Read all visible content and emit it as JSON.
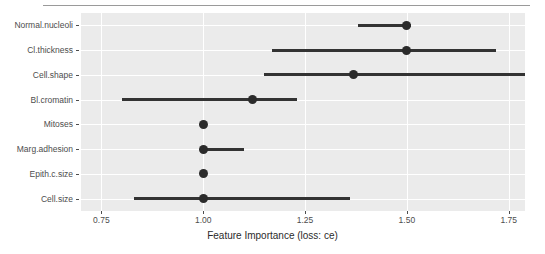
{
  "chart_data": {
    "type": "bar",
    "title": "",
    "subtitle": "",
    "xlabel": "Feature Importance (loss: ce)",
    "ylabel": "",
    "xlim": [
      0.7,
      1.79
    ],
    "xticks": [
      0.75,
      1.0,
      1.25,
      1.5,
      1.75
    ],
    "xticklabels": [
      "0.75",
      "1.00",
      "1.25",
      "1.50",
      "1.75"
    ],
    "grid": true,
    "legend": null,
    "categories": [
      "Normal.nucleoli",
      "Cl.thickness",
      "Cell.shape",
      "Bl.cromatin",
      "Mitoses",
      "Marg.adhesion",
      "Epith.c.size",
      "Cell.size"
    ],
    "values": [
      1.5,
      1.5,
      1.37,
      1.12,
      1.0,
      1.0,
      1.0,
      1.0
    ],
    "series": [
      {
        "name": "dropout loss",
        "values": [
          1.5,
          1.5,
          1.37,
          1.12,
          1.0,
          1.0,
          1.0,
          1.0
        ]
      }
    ],
    "intervals": [
      {
        "label": "Normal.nucleoli",
        "low": 1.38,
        "high": 1.51,
        "point": 1.5
      },
      {
        "label": "Cl.thickness",
        "low": 1.17,
        "high": 1.72,
        "point": 1.5
      },
      {
        "label": "Cell.shape",
        "low": 1.15,
        "high": 1.8,
        "point": 1.37
      },
      {
        "label": "Bl.cromatin",
        "low": 0.8,
        "high": 1.23,
        "point": 1.12
      },
      {
        "label": "Mitoses",
        "low": 1.0,
        "high": 1.0,
        "point": 1.0
      },
      {
        "label": "Marg.adhesion",
        "low": 1.0,
        "high": 1.1,
        "point": 1.0
      },
      {
        "label": "Epith.c.size",
        "low": 1.0,
        "high": 1.0,
        "point": 1.0
      },
      {
        "label": "Cell.size",
        "low": 0.83,
        "high": 1.36,
        "point": 1.0
      }
    ],
    "colors": {
      "panel": "#ebebeb",
      "grid": "#ffffff",
      "bar": "#333333",
      "point": "#2b2b2b",
      "axis_text": "#4d4d4d",
      "title_text": "#2b2b2b",
      "rule": "#9a9a9a"
    }
  }
}
